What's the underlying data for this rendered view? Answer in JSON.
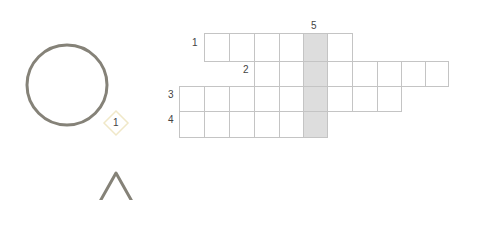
{
  "puzzle": {
    "type": "crossword-grid",
    "rows": [
      {
        "number": "1",
        "label_x": 192,
        "label_y": 38,
        "top": 33,
        "height": 28,
        "cols": [
          204,
          229,
          254,
          279,
          303,
          327,
          352
        ]
      },
      {
        "number": "2",
        "label_x": 243,
        "label_y": 65,
        "top": 61,
        "height": 25,
        "cols": [
          254,
          279,
          303,
          327,
          352,
          377,
          401,
          425,
          448
        ]
      },
      {
        "number": "3",
        "label_x": 168,
        "label_y": 90,
        "top": 86,
        "height": 25,
        "cols": [
          179,
          204,
          229,
          254,
          279,
          303,
          327,
          352,
          377,
          401
        ]
      },
      {
        "number": "4",
        "label_x": 168,
        "label_y": 115,
        "top": 111,
        "height": 26,
        "cols": [
          179,
          204,
          229,
          254,
          279,
          303,
          327
        ]
      }
    ],
    "vertical_clue": {
      "number": "5",
      "label_x": 311,
      "label_y": 21,
      "x": 303,
      "width": 24,
      "top": 33,
      "bottom": 137
    },
    "colors": {
      "grid_line": "#c4c4c4",
      "shaded": "#dddddd",
      "shape_stroke": "#858278",
      "badge_border": "#f0e8c8"
    }
  },
  "shapes": {
    "circle": {
      "name": "circle",
      "cx": 67,
      "cy": 85,
      "r": 40
    },
    "badge": {
      "text": "1",
      "cx": 116,
      "cy": 123
    },
    "triangle": {
      "name": "triangle",
      "apex_x": 116,
      "apex_y": 172
    }
  }
}
